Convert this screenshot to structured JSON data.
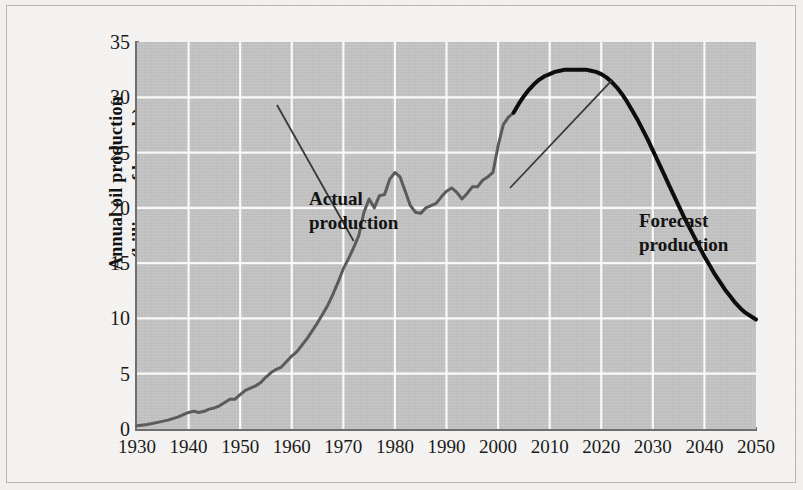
{
  "figure": {
    "background_color": "#f4f3f1",
    "plot_background_color": "#c5c5c5",
    "gridline_color": "#ffffff",
    "axis_color": "#6f6f6f"
  },
  "chart_data": {
    "type": "line",
    "title": "",
    "xlabel": "",
    "ylabel": "Annual oil production (billions of barrels)",
    "ylabel_line1": "Annual oil production",
    "ylabel_line2": "(billions of barrels)",
    "xlim": [
      1930,
      2050
    ],
    "ylim": [
      0,
      35
    ],
    "ytick_values": [
      0,
      5,
      10,
      15,
      20,
      25,
      30,
      35
    ],
    "ytick_labels": [
      "0",
      "5",
      "10",
      "15",
      "20",
      "25",
      "30",
      "35"
    ],
    "xtick_values": [
      1930,
      1940,
      1950,
      1960,
      1970,
      1980,
      1990,
      2000,
      2010,
      2020,
      2030,
      2040,
      2050
    ],
    "xtick_labels": [
      "1930",
      "1940",
      "1950",
      "1960",
      "1970",
      "1980",
      "1990",
      "2000",
      "2010",
      "2020",
      "2030",
      "2040",
      "2050"
    ],
    "grid": true,
    "legend": "none",
    "series": [
      {
        "name": "Actual production",
        "color": "#5c5c5c",
        "line_width": 3.0,
        "x": [
          1930,
          1932,
          1934,
          1936,
          1938,
          1940,
          1941,
          1942,
          1943,
          1944,
          1945,
          1946,
          1947,
          1948,
          1949,
          1950,
          1951,
          1952,
          1953,
          1954,
          1955,
          1956,
          1957,
          1958,
          1959,
          1960,
          1961,
          1962,
          1963,
          1964,
          1965,
          1966,
          1967,
          1968,
          1969,
          1970,
          1971,
          1972,
          1973,
          1974,
          1975,
          1976,
          1977,
          1978,
          1979,
          1980,
          1981,
          1982,
          1983,
          1984,
          1985,
          1986,
          1987,
          1988,
          1989,
          1990,
          1991,
          1992,
          1993,
          1994,
          1995,
          1996,
          1997,
          1998,
          1999,
          2000,
          2001,
          2002,
          2003
        ],
        "y": [
          0.3,
          0.4,
          0.6,
          0.8,
          1.1,
          1.5,
          1.6,
          1.5,
          1.6,
          1.8,
          1.9,
          2.1,
          2.4,
          2.7,
          2.7,
          3.1,
          3.5,
          3.7,
          3.9,
          4.2,
          4.7,
          5.1,
          5.4,
          5.6,
          6.1,
          6.6,
          7.0,
          7.6,
          8.2,
          8.9,
          9.6,
          10.4,
          11.2,
          12.2,
          13.3,
          14.5,
          15.4,
          16.4,
          17.5,
          19.6,
          20.8,
          20.0,
          21.1,
          21.2,
          22.6,
          23.2,
          22.8,
          21.5,
          20.2,
          19.6,
          19.5,
          20.0,
          20.2,
          20.4,
          21.0,
          21.5,
          21.8,
          21.4,
          20.8,
          21.3,
          21.9,
          21.9,
          22.5,
          22.8,
          23.2,
          25.6,
          27.5,
          28.2,
          28.6
        ]
      },
      {
        "name": "Forecast production",
        "color": "#0d0d0d",
        "line_width": 4.0,
        "x": [
          2003,
          2004,
          2005,
          2006,
          2007,
          2008,
          2009,
          2010,
          2011,
          2012,
          2013,
          2014,
          2015,
          2016,
          2017,
          2018,
          2019,
          2020,
          2021,
          2022,
          2023,
          2024,
          2025,
          2026,
          2027,
          2028,
          2029,
          2030,
          2031,
          2032,
          2033,
          2034,
          2035,
          2036,
          2037,
          2038,
          2039,
          2040,
          2041,
          2042,
          2043,
          2044,
          2045,
          2046,
          2047,
          2048,
          2049,
          2050
        ],
        "y": [
          28.6,
          29.4,
          30.1,
          30.7,
          31.2,
          31.6,
          31.9,
          32.1,
          32.3,
          32.4,
          32.5,
          32.5,
          32.5,
          32.5,
          32.5,
          32.4,
          32.3,
          32.1,
          31.8,
          31.4,
          30.9,
          30.3,
          29.6,
          28.8,
          28.0,
          27.1,
          26.2,
          25.2,
          24.2,
          23.2,
          22.2,
          21.2,
          20.2,
          19.2,
          18.3,
          17.4,
          16.5,
          15.6,
          14.8,
          14.0,
          13.3,
          12.6,
          12.0,
          11.4,
          10.9,
          10.5,
          10.2,
          9.9
        ]
      }
    ],
    "annotations": [
      {
        "id": "actual",
        "line1": "Actual",
        "line2": "production",
        "text": "Actual production",
        "points_to_year": 1972,
        "points_to_value": 17.0
      },
      {
        "id": "forecast",
        "line1": "Forecast",
        "line2": "production",
        "text": "Forecast production",
        "points_to_year": 2022,
        "points_to_value": 31.5
      }
    ]
  }
}
